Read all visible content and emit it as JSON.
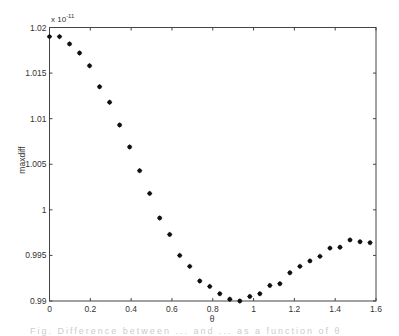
{
  "chart_data": {
    "type": "scatter",
    "title": "",
    "xlabel": "θ",
    "ylabel": "maxdiff",
    "y_exponent_label": "x 10",
    "y_exponent_power": "-11",
    "xlim": [
      0,
      1.6
    ],
    "ylim": [
      0.99,
      1.02
    ],
    "grid": false,
    "legend": null,
    "marker": "*",
    "x_ticks": [
      0,
      0.2,
      0.4,
      0.6,
      0.8,
      1.0,
      1.2,
      1.4,
      1.6
    ],
    "x_tick_labels": [
      "0",
      "0.2",
      "0.4",
      "0.6",
      "0.8",
      "1",
      "1.2",
      "1.4",
      "1.6"
    ],
    "y_ticks": [
      0.99,
      0.995,
      1.0,
      1.005,
      1.01,
      1.015,
      1.02
    ],
    "y_tick_labels": [
      "0.99",
      "0.995",
      "1",
      "1.005",
      "1.01",
      "1.015",
      "1.02"
    ],
    "series": [
      {
        "name": "maxdiff",
        "x": [
          0,
          0.0491,
          0.0982,
          0.1473,
          0.1963,
          0.2454,
          0.2945,
          0.3436,
          0.3927,
          0.4418,
          0.4909,
          0.54,
          0.589,
          0.6381,
          0.6872,
          0.7363,
          0.7854,
          0.8345,
          0.8836,
          0.9327,
          0.9817,
          1.0308,
          1.0799,
          1.129,
          1.1781,
          1.2272,
          1.2763,
          1.3254,
          1.3744,
          1.4235,
          1.4726,
          1.5217,
          1.5708
        ],
        "values": [
          1.019,
          1.019,
          1.0182,
          1.0172,
          1.0158,
          1.0135,
          1.0118,
          1.0093,
          1.0069,
          1.0043,
          1.0018,
          0.9991,
          0.9973,
          0.995,
          0.9938,
          0.9922,
          0.9916,
          0.9908,
          0.9902,
          0.99,
          0.9905,
          0.9908,
          0.9917,
          0.9919,
          0.9931,
          0.9938,
          0.9944,
          0.9949,
          0.9958,
          0.9959,
          0.9967,
          0.9965,
          0.9964
        ]
      }
    ]
  },
  "caption_fragment": "Fig. Difference between ... and ... as a function of θ"
}
